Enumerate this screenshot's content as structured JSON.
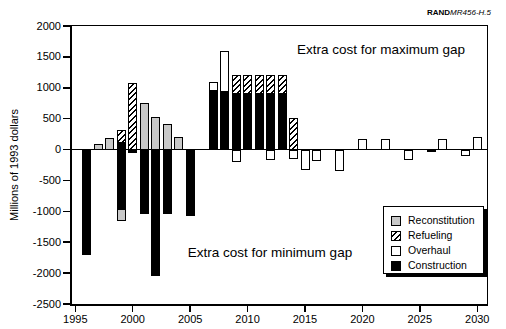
{
  "branding": {
    "brand": "RAND",
    "reference": "MR456-H.5"
  },
  "annotations": {
    "max_gap": "Extra cost for maximum gap",
    "min_gap": "Extra cost for minimum gap"
  },
  "y_axis": {
    "label": "Millions of 1993 dollars",
    "ticks": [
      2000,
      1500,
      1000,
      500,
      0,
      -500,
      -1000,
      -1500,
      -2000,
      -2500
    ]
  },
  "x_axis": {
    "ticks": [
      1995,
      2000,
      2005,
      2010,
      2015,
      2020,
      2025,
      2030
    ]
  },
  "legend": {
    "items": [
      {
        "label": "Reconstitution",
        "pattern": "gray",
        "color": "#c8c8c8"
      },
      {
        "label": "Refueling",
        "pattern": "hatch",
        "color": "#000000"
      },
      {
        "label": "Overhaul",
        "pattern": "white",
        "color": "#ffffff"
      },
      {
        "label": "Construction",
        "pattern": "black",
        "color": "#000000"
      }
    ]
  },
  "chart_data": {
    "type": "bar",
    "stacked": true,
    "title": "",
    "xlabel": "",
    "ylabel": "Millions of 1993 dollars",
    "units": "millions of 1993 dollars",
    "ylim": [
      -2500,
      2000
    ],
    "xlim": [
      1995,
      2030
    ],
    "grid": false,
    "legend_position": "lower right",
    "categories_legend": [
      "Reconstitution",
      "Refueling",
      "Overhaul",
      "Construction"
    ],
    "bars": [
      {
        "year": 1996,
        "segments": [
          {
            "category": "Construction",
            "value": -1700
          }
        ]
      },
      {
        "year": 1997,
        "segments": [
          {
            "category": "Reconstitution",
            "value": 90
          }
        ]
      },
      {
        "year": 1998,
        "segments": [
          {
            "category": "Reconstitution",
            "value": 180
          }
        ]
      },
      {
        "year": 1999,
        "segments": [
          {
            "category": "Construction",
            "value": 110
          },
          {
            "category": "Refueling",
            "value": 210
          },
          {
            "category": "Construction",
            "value": -960
          },
          {
            "category": "Reconstitution",
            "value": -190
          }
        ]
      },
      {
        "year": 2000,
        "segments": [
          {
            "category": "Refueling",
            "value": 1070
          },
          {
            "category": "Construction",
            "value": -60
          }
        ]
      },
      {
        "year": 2001,
        "segments": [
          {
            "category": "Reconstitution",
            "value": 750
          },
          {
            "category": "Construction",
            "value": -1050
          }
        ]
      },
      {
        "year": 2002,
        "segments": [
          {
            "category": "Reconstitution",
            "value": 520
          },
          {
            "category": "Construction",
            "value": -2050
          }
        ]
      },
      {
        "year": 2003,
        "segments": [
          {
            "category": "Reconstitution",
            "value": 420
          },
          {
            "category": "Construction",
            "value": -1040
          }
        ]
      },
      {
        "year": 2004,
        "segments": [
          {
            "category": "Reconstitution",
            "value": 200
          }
        ]
      },
      {
        "year": 2005,
        "segments": [
          {
            "category": "Construction",
            "value": -1070
          }
        ]
      },
      {
        "year": 2007,
        "segments": [
          {
            "category": "Construction",
            "value": 950
          },
          {
            "category": "Overhaul",
            "value": 150
          }
        ]
      },
      {
        "year": 2008,
        "segments": [
          {
            "category": "Construction",
            "value": 925
          },
          {
            "category": "Overhaul",
            "value": 675
          }
        ]
      },
      {
        "year": 2009,
        "segments": [
          {
            "category": "Construction",
            "value": 900
          },
          {
            "category": "Refueling",
            "value": 300
          },
          {
            "category": "Overhaul",
            "value": -200
          }
        ]
      },
      {
        "year": 2010,
        "segments": [
          {
            "category": "Construction",
            "value": 900
          },
          {
            "category": "Refueling",
            "value": 300
          }
        ]
      },
      {
        "year": 2011,
        "segments": [
          {
            "category": "Construction",
            "value": 900
          },
          {
            "category": "Refueling",
            "value": 300
          }
        ]
      },
      {
        "year": 2012,
        "segments": [
          {
            "category": "Construction",
            "value": 900
          },
          {
            "category": "Refueling",
            "value": 300
          },
          {
            "category": "Overhaul",
            "value": -170
          }
        ]
      },
      {
        "year": 2013,
        "segments": [
          {
            "category": "Construction",
            "value": 900
          },
          {
            "category": "Refueling",
            "value": 300
          }
        ]
      },
      {
        "year": 2014,
        "segments": [
          {
            "category": "Refueling",
            "value": 510
          },
          {
            "category": "Overhaul",
            "value": -150
          }
        ]
      },
      {
        "year": 2015,
        "segments": [
          {
            "category": "Overhaul",
            "value": -330
          }
        ]
      },
      {
        "year": 2016,
        "segments": [
          {
            "category": "Overhaul",
            "value": -180
          }
        ]
      },
      {
        "year": 2018,
        "segments": [
          {
            "category": "Overhaul",
            "value": -350
          }
        ]
      },
      {
        "year": 2020,
        "segments": [
          {
            "category": "Overhaul",
            "value": 170
          }
        ]
      },
      {
        "year": 2022,
        "segments": [
          {
            "category": "Overhaul",
            "value": 170
          }
        ]
      },
      {
        "year": 2024,
        "segments": [
          {
            "category": "Overhaul",
            "value": -170
          }
        ]
      },
      {
        "year": 2026,
        "segments": [
          {
            "category": "Construction",
            "value": -30
          }
        ]
      },
      {
        "year": 2027,
        "segments": [
          {
            "category": "Overhaul",
            "value": 170
          }
        ]
      },
      {
        "year": 2029,
        "segments": [
          {
            "category": "Overhaul",
            "value": -100
          }
        ]
      },
      {
        "year": 2030,
        "segments": [
          {
            "category": "Overhaul",
            "value": 200
          }
        ]
      }
    ]
  }
}
